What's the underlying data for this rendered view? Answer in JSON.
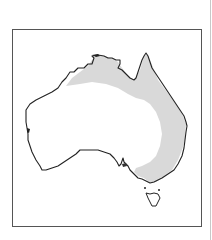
{
  "map": {
    "region": "Australia",
    "kind": "species distribution range map",
    "colors": {
      "land": "#ffffff",
      "range_fill": "#d9d9d9",
      "coastline": "#222222",
      "frame": "#555555",
      "background": "#ffffff"
    },
    "legend": null,
    "range_description": "Shaded band across northern coast and down the eastern seaboard to the south-east"
  }
}
